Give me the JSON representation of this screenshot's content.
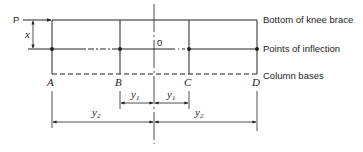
{
  "diagram": {
    "load_label": "P",
    "height_label": "x",
    "origin_label": "0",
    "columns": [
      {
        "id": "A",
        "label": "A"
      },
      {
        "id": "B",
        "label": "B"
      },
      {
        "id": "C",
        "label": "C"
      },
      {
        "id": "D",
        "label": "D"
      }
    ],
    "right_labels": {
      "top": "Bottom of knee brace",
      "middle": "Points of inflection",
      "bottom": "Column bases"
    },
    "dimensions": {
      "y1_left": "y",
      "y1_left_sub": "1",
      "y1_right": "y",
      "y1_right_sub": "1",
      "y2_left": "y",
      "y2_left_sub": "2",
      "y2_right": "y",
      "y2_right_sub": "2"
    },
    "colors": {
      "line": "#222222",
      "background": "#ffffff"
    }
  }
}
